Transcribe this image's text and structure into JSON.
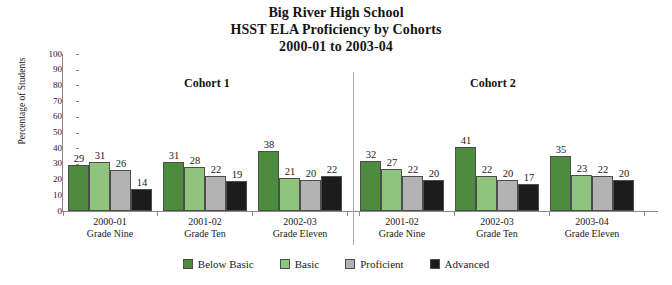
{
  "title": {
    "line1": "Big River High School",
    "line2": "HSST ELA Proficiency by Cohorts",
    "line3": "2000-01 to 2003-04"
  },
  "cohort_headers": {
    "left": "Cohort 1",
    "right": "Cohort 2"
  },
  "chart_data": {
    "type": "bar",
    "title": "Big River High School HSST ELA Proficiency by Cohorts 2000-01 to 2003-04",
    "xlabel": "",
    "ylabel": "Percentage of Students",
    "ylim": [
      0,
      100
    ],
    "ytick_step": 10,
    "yticks": [
      "100",
      "90",
      "80",
      "70",
      "60",
      "50",
      "40",
      "30",
      "20",
      "10",
      "0"
    ],
    "grid": false,
    "legend_position": "bottom",
    "legend": [
      "Below Basic",
      "Basic",
      "Proficient",
      "Advanced"
    ],
    "series": [
      {
        "name": "Below Basic",
        "color": "#4d8c3f",
        "values": [
          29,
          31,
          38,
          32,
          41,
          35
        ]
      },
      {
        "name": "Basic",
        "color": "#8fc47e",
        "values": [
          31,
          28,
          21,
          27,
          22,
          23
        ]
      },
      {
        "name": "Proficient",
        "color": "#b3b3b3",
        "values": [
          26,
          22,
          20,
          22,
          20,
          22
        ]
      },
      {
        "name": "Advanced",
        "color": "#1c1c1c",
        "values": [
          14,
          19,
          22,
          20,
          17,
          20
        ]
      }
    ],
    "categories": [
      {
        "year": "2000-01",
        "grade": "Grade Nine",
        "cohort": "Cohort 1"
      },
      {
        "year": "2001-02",
        "grade": "Grade Ten",
        "cohort": "Cohort 1"
      },
      {
        "year": "2002-03",
        "grade": "Grade Eleven",
        "cohort": "Cohort 1"
      },
      {
        "year": "2001-02",
        "grade": "Grade Nine",
        "cohort": "Cohort 2"
      },
      {
        "year": "2002-03",
        "grade": "Grade Ten",
        "cohort": "Cohort 2"
      },
      {
        "year": "2003-04",
        "grade": "Grade Eleven",
        "cohort": "Cohort 2"
      }
    ]
  },
  "colors": {
    "below_basic": "#4d8c3f",
    "basic": "#8fc47e",
    "proficient": "#b3b3b3",
    "advanced": "#1c1c1c",
    "axis": "#8a8a8a",
    "text": "#1a1a1a"
  }
}
